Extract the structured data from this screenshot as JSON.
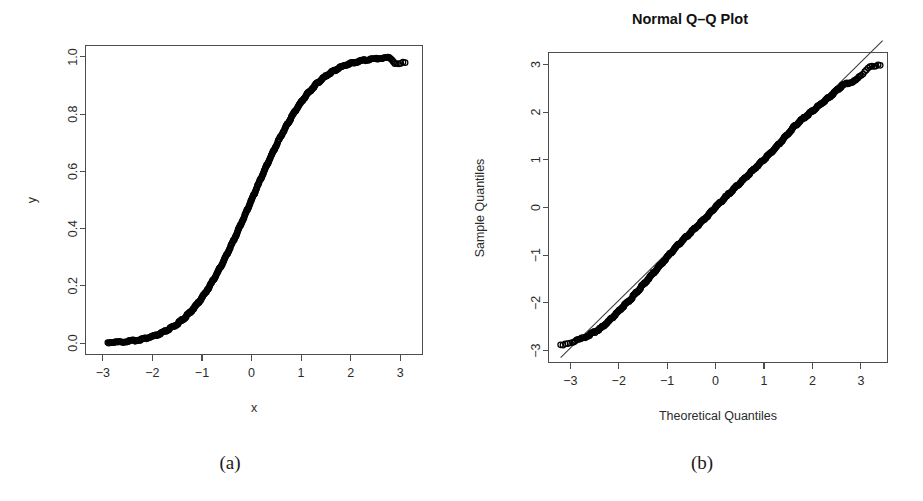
{
  "figure": {
    "background_color": "#ffffff",
    "point_color": "#000000",
    "axis_color": "#4d4d4d",
    "captions": [
      {
        "id": "a",
        "label": "(a)"
      },
      {
        "id": "b",
        "label": "(b)"
      }
    ]
  },
  "chart_data": [
    {
      "panel": "(a)",
      "type": "scatter",
      "title": "",
      "xlabel": "x",
      "ylabel": "y",
      "xlim": [
        -3.35,
        3.45
      ],
      "ylim": [
        -0.04,
        1.04
      ],
      "xticks": [
        "-3",
        "-2",
        "-1",
        "0",
        "1",
        "2",
        "3"
      ],
      "xtick_values": [
        -3,
        -2,
        -1,
        0,
        1,
        2,
        3
      ],
      "yticks": [
        "0.0",
        "0.2",
        "0.4",
        "0.6",
        "0.8",
        "1.0"
      ],
      "ytick_values": [
        0.0,
        0.2,
        0.4,
        0.6,
        0.8,
        1.0
      ],
      "grid": false,
      "legend": "none",
      "description": "Empirical cumulative distribution (normal CDF S-curve) of x against y; dense open-circle markers form a continuous sigmoid from (-2.9, 0.00) to (3.1, 0.98).",
      "marker": "open-circle",
      "n_points": 500,
      "curve": "normal-cdf",
      "x": [
        -2.9,
        -2.8,
        -2.72,
        -2.63,
        -2.55,
        -2.47,
        -2.39,
        -2.31,
        -2.24,
        -2.17,
        -2.1,
        -2.04,
        -1.98,
        -1.92,
        -1.86,
        -1.8,
        -1.74,
        -1.69,
        -1.63,
        -1.58,
        -1.52,
        -1.47,
        -1.42,
        -1.37,
        -1.32,
        -1.27,
        -1.22,
        -1.17,
        -1.12,
        -1.07,
        -1.02,
        -0.98,
        -0.93,
        -0.88,
        -0.84,
        -0.79,
        -0.75,
        -0.7,
        -0.66,
        -0.61,
        -0.57,
        -0.53,
        -0.48,
        -0.44,
        -0.4,
        -0.35,
        -0.31,
        -0.27,
        -0.23,
        -0.19,
        -0.14,
        -0.1,
        -0.06,
        -0.02,
        0.02,
        0.06,
        0.1,
        0.14,
        0.19,
        0.23,
        0.27,
        0.31,
        0.35,
        0.4,
        0.44,
        0.48,
        0.53,
        0.57,
        0.61,
        0.66,
        0.7,
        0.75,
        0.79,
        0.84,
        0.88,
        0.93,
        0.98,
        1.02,
        1.07,
        1.12,
        1.17,
        1.22,
        1.27,
        1.32,
        1.37,
        1.42,
        1.47,
        1.52,
        1.58,
        1.63,
        1.69,
        1.74,
        1.8,
        1.86,
        1.92,
        1.98,
        2.04,
        2.1,
        2.17,
        2.24,
        2.31,
        2.39,
        2.47,
        2.55,
        2.63,
        2.72,
        2.8,
        2.9,
        3.1
      ],
      "y": [
        0.002,
        0.003,
        0.003,
        0.004,
        0.005,
        0.007,
        0.008,
        0.01,
        0.013,
        0.015,
        0.018,
        0.021,
        0.024,
        0.027,
        0.031,
        0.036,
        0.041,
        0.046,
        0.052,
        0.057,
        0.064,
        0.071,
        0.078,
        0.085,
        0.093,
        0.102,
        0.111,
        0.121,
        0.131,
        0.142,
        0.154,
        0.164,
        0.176,
        0.189,
        0.2,
        0.215,
        0.227,
        0.242,
        0.255,
        0.271,
        0.284,
        0.298,
        0.316,
        0.33,
        0.345,
        0.363,
        0.378,
        0.394,
        0.409,
        0.425,
        0.444,
        0.46,
        0.476,
        0.492,
        0.508,
        0.524,
        0.54,
        0.556,
        0.575,
        0.591,
        0.606,
        0.622,
        0.637,
        0.655,
        0.67,
        0.684,
        0.702,
        0.716,
        0.729,
        0.745,
        0.758,
        0.773,
        0.785,
        0.8,
        0.811,
        0.824,
        0.836,
        0.846,
        0.858,
        0.869,
        0.879,
        0.889,
        0.898,
        0.907,
        0.915,
        0.922,
        0.929,
        0.936,
        0.943,
        0.948,
        0.954,
        0.959,
        0.964,
        0.969,
        0.973,
        0.976,
        0.979,
        0.982,
        0.985,
        0.987,
        0.99,
        0.992,
        0.993,
        0.995,
        0.996,
        0.997,
        0.997,
        0.978,
        0.98
      ]
    },
    {
      "panel": "(b)",
      "type": "scatter",
      "title": "Normal Q-Q Plot",
      "xlabel": "Theoretical Quantiles",
      "ylabel": "Sample Quantiles",
      "xlim": [
        -3.45,
        3.55
      ],
      "ylim": [
        -3.25,
        3.25
      ],
      "xticks": [
        "-3",
        "-2",
        "-1",
        "0",
        "1",
        "2",
        "3"
      ],
      "xtick_values": [
        -3,
        -2,
        -1,
        0,
        1,
        2,
        3
      ],
      "yticks": [
        "-3",
        "-2",
        "-1",
        "0",
        "1",
        "2",
        "3"
      ],
      "ytick_values": [
        -3,
        -2,
        -1,
        0,
        1,
        2,
        3
      ],
      "grid": false,
      "legend": "none",
      "reference_line": {
        "slope": 1.0,
        "intercept": 0.05,
        "x_from": -3.2,
        "x_to": 3.45
      },
      "description": "Normal quantile-quantile plot; dense open-circle markers follow the 45-degree reference line closely through the centre, lying slightly above the line in the lower tail and slightly below it in the upper tail.",
      "marker": "open-circle",
      "n_points": 500,
      "theoretical": [
        -3.2,
        -2.95,
        -2.8,
        -2.7,
        -2.62,
        -2.55,
        -2.48,
        -2.42,
        -2.36,
        -2.3,
        -2.24,
        -2.18,
        -2.12,
        -2.06,
        -2.0,
        -1.94,
        -1.88,
        -1.82,
        -1.76,
        -1.7,
        -1.64,
        -1.58,
        -1.52,
        -1.46,
        -1.4,
        -1.34,
        -1.28,
        -1.22,
        -1.16,
        -1.1,
        -1.04,
        -0.98,
        -0.92,
        -0.86,
        -0.8,
        -0.74,
        -0.68,
        -0.62,
        -0.56,
        -0.5,
        -0.44,
        -0.38,
        -0.32,
        -0.26,
        -0.2,
        -0.14,
        -0.08,
        -0.02,
        0.04,
        0.1,
        0.16,
        0.22,
        0.28,
        0.34,
        0.4,
        0.46,
        0.52,
        0.58,
        0.64,
        0.7,
        0.76,
        0.82,
        0.88,
        0.94,
        1.0,
        1.06,
        1.12,
        1.18,
        1.24,
        1.3,
        1.36,
        1.42,
        1.48,
        1.54,
        1.6,
        1.66,
        1.72,
        1.78,
        1.84,
        1.9,
        1.96,
        2.02,
        2.08,
        2.14,
        2.2,
        2.26,
        2.32,
        2.38,
        2.44,
        2.5,
        2.56,
        2.62,
        2.7,
        2.78,
        2.88,
        3.0,
        3.18,
        3.4
      ],
      "sample": [
        -2.88,
        -2.82,
        -2.76,
        -2.72,
        -2.68,
        -2.64,
        -2.6,
        -2.56,
        -2.52,
        -2.47,
        -2.42,
        -2.36,
        -2.3,
        -2.24,
        -2.18,
        -2.11,
        -2.05,
        -1.99,
        -1.93,
        -1.86,
        -1.79,
        -1.72,
        -1.65,
        -1.58,
        -1.51,
        -1.44,
        -1.37,
        -1.3,
        -1.23,
        -1.16,
        -1.09,
        -1.02,
        -0.95,
        -0.88,
        -0.81,
        -0.75,
        -0.69,
        -0.63,
        -0.57,
        -0.51,
        -0.45,
        -0.39,
        -0.33,
        -0.27,
        -0.21,
        -0.15,
        -0.08,
        -0.01,
        0.05,
        0.11,
        0.17,
        0.23,
        0.29,
        0.35,
        0.41,
        0.47,
        0.53,
        0.59,
        0.65,
        0.71,
        0.77,
        0.83,
        0.89,
        0.95,
        1.01,
        1.07,
        1.13,
        1.19,
        1.25,
        1.32,
        1.39,
        1.46,
        1.53,
        1.6,
        1.67,
        1.73,
        1.79,
        1.84,
        1.89,
        1.94,
        1.99,
        2.04,
        2.09,
        2.14,
        2.19,
        2.24,
        2.29,
        2.34,
        2.4,
        2.45,
        2.51,
        2.56,
        2.6,
        2.62,
        2.66,
        2.76,
        2.97,
        2.98
      ]
    }
  ]
}
